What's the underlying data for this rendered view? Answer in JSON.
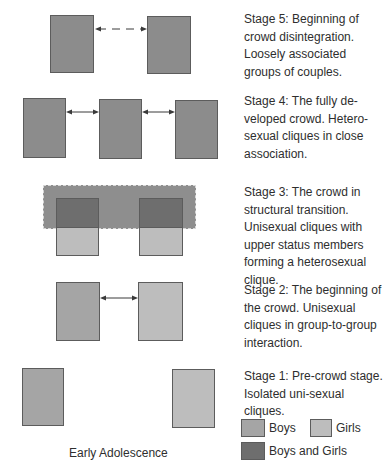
{
  "diagram": {
    "title": "Early Adolescence",
    "stages": [
      {
        "id": 5,
        "caption": "Stage 5: Beginning of crowd disintegration. Loosely associated groups of couples."
      },
      {
        "id": 4,
        "caption": "Stage 4: The fully de-veloped crowd. Hetero-sexual cliques in close association."
      },
      {
        "id": 3,
        "caption": "Stage 3: The crowd in structural transition. Unisexual cliques with upper status members forming a heterosexual clique."
      },
      {
        "id": 2,
        "caption": "Stage 2: The beginning of the crowd. Unisexual cliques in group-to-group interaction."
      },
      {
        "id": 1,
        "caption": "Stage 1: Pre-crowd stage. Isolated uni-sexual cliques."
      }
    ],
    "legend": [
      {
        "label": "Boys",
        "color": "#a5a5a5"
      },
      {
        "label": "Girls",
        "color": "#bdbdbd"
      },
      {
        "label": "Boys and Girls",
        "color": "#6e6e6e"
      }
    ],
    "colors": {
      "heterosexual_clique": "#8c8c8c",
      "boys": "#a5a5a5",
      "girls": "#bdbdbd",
      "boys_and_girls": "#6e6e6e",
      "crowd": "#8e8e8e"
    }
  }
}
